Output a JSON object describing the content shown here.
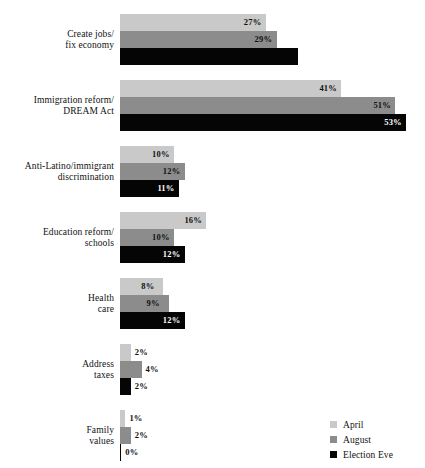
{
  "chart": {
    "title": ""
  },
  "chart_data": {
    "type": "bar",
    "orientation": "horizontal",
    "title": "",
    "xlabel": "",
    "ylabel": "",
    "xlim": [
      0,
      55
    ],
    "grid": false,
    "legend_position": "bottom-right",
    "categories": [
      "Create jobs/\nfix economy",
      "Immigration reform/\nDREAM Act",
      "Anti-Latino/immigrant\ndiscrimination",
      "Education reform/\nschools",
      "Health\ncare",
      "Address\ntaxes",
      "Family\nvalues"
    ],
    "series": [
      {
        "name": "April",
        "color": "#c9c9c9",
        "values": [
          27,
          41,
          10,
          16,
          8,
          2,
          1
        ]
      },
      {
        "name": "August",
        "color": "#8c8c8c",
        "values": [
          29,
          51,
          12,
          10,
          9,
          4,
          2
        ]
      },
      {
        "name": "Election Eve",
        "color": "#050505",
        "values": [
          33,
          53,
          11,
          12,
          12,
          2,
          0
        ]
      }
    ]
  },
  "groups": [
    {
      "label_line1": "Create jobs/",
      "label_line2": "fix economy",
      "bars": [
        {
          "series": "April",
          "value": 27,
          "label": "27%",
          "label_style": "inside"
        },
        {
          "series": "August",
          "value": 29,
          "label": "29%",
          "label_style": "inside"
        },
        {
          "series": "Election Eve",
          "value": 33,
          "label": "33%",
          "label_style": "hidden-on-black"
        }
      ]
    },
    {
      "label_line1": "Immigration reform/",
      "label_line2": "DREAM Act",
      "bars": [
        {
          "series": "April",
          "value": 41,
          "label": "41%",
          "label_style": "inside"
        },
        {
          "series": "August",
          "value": 51,
          "label": "51%",
          "label_style": "inside"
        },
        {
          "series": "Election Eve",
          "value": 53,
          "label": "53%",
          "label_style": "inside-light"
        }
      ]
    },
    {
      "label_line1": "Anti-Latino/immigrant",
      "label_line2": "discrimination",
      "bars": [
        {
          "series": "April",
          "value": 10,
          "label": "10%",
          "label_style": "inside"
        },
        {
          "series": "August",
          "value": 12,
          "label": "12%",
          "label_style": "inside"
        },
        {
          "series": "Election Eve",
          "value": 11,
          "label": "11%",
          "label_style": "inside-light"
        }
      ]
    },
    {
      "label_line1": "Education reform/",
      "label_line2": "schools",
      "bars": [
        {
          "series": "April",
          "value": 16,
          "label": "16%",
          "label_style": "inside"
        },
        {
          "series": "August",
          "value": 10,
          "label": "10%",
          "label_style": "inside"
        },
        {
          "series": "Election Eve",
          "value": 12,
          "label": "12%",
          "label_style": "inside-light"
        }
      ]
    },
    {
      "label_line1": "Health",
      "label_line2": "care",
      "bars": [
        {
          "series": "April",
          "value": 8,
          "label": "8%",
          "label_style": "inside"
        },
        {
          "series": "August",
          "value": 9,
          "label": "9%",
          "label_style": "inside"
        },
        {
          "series": "Election Eve",
          "value": 12,
          "label": "12%",
          "label_style": "inside-light"
        }
      ]
    },
    {
      "label_line1": "Address",
      "label_line2": "taxes",
      "bars": [
        {
          "series": "April",
          "value": 2,
          "label": "2%",
          "label_style": "outside"
        },
        {
          "series": "August",
          "value": 4,
          "label": "4%",
          "label_style": "outside"
        },
        {
          "series": "Election Eve",
          "value": 2,
          "label": "2%",
          "label_style": "outside"
        }
      ]
    },
    {
      "label_line1": "Family",
      "label_line2": "values",
      "bars": [
        {
          "series": "April",
          "value": 1,
          "label": "1%",
          "label_style": "outside"
        },
        {
          "series": "August",
          "value": 2,
          "label": "2%",
          "label_style": "outside"
        },
        {
          "series": "Election Eve",
          "value": 0,
          "label": "0%",
          "label_style": "outside"
        }
      ]
    }
  ],
  "legend": {
    "items": [
      {
        "label": "April",
        "color": "#c9c9c9"
      },
      {
        "label": "August",
        "color": "#8c8c8c"
      },
      {
        "label": "Election Eve",
        "color": "#050505"
      }
    ]
  }
}
